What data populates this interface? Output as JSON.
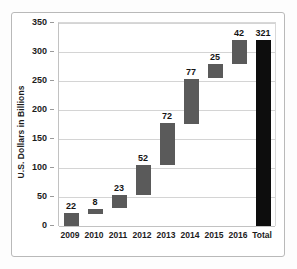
{
  "chart_data": {
    "type": "bar",
    "subtype": "waterfall",
    "title": "",
    "xlabel": "",
    "ylabel": "U.S. Dollars in Billions",
    "ylim": [
      0,
      350
    ],
    "ytick_values": [
      0,
      50,
      100,
      150,
      200,
      250,
      300,
      350
    ],
    "ytick_labels": [
      "0",
      "50",
      "100",
      "150",
      "200",
      "250",
      "300",
      "350"
    ],
    "grid": true,
    "legend": "none",
    "categories": [
      "2009",
      "2010",
      "2011",
      "2012",
      "2013",
      "2014",
      "2015",
      "2016",
      "Total"
    ],
    "values": [
      22,
      8,
      23,
      52,
      72,
      77,
      25,
      42,
      321
    ],
    "data_labels": [
      "22",
      "8",
      "23",
      "52",
      "72",
      "77",
      "25",
      "42",
      "321"
    ],
    "bars": [
      {
        "category": "2009",
        "label": "22",
        "value": 22,
        "base": 0,
        "top": 22,
        "kind": "increment",
        "color": "#5a5a5a"
      },
      {
        "category": "2010",
        "label": "8",
        "value": 8,
        "base": 22,
        "top": 30,
        "kind": "increment",
        "color": "#5a5a5a"
      },
      {
        "category": "2011",
        "label": "23",
        "value": 23,
        "base": 30,
        "top": 53,
        "kind": "increment",
        "color": "#5a5a5a"
      },
      {
        "category": "2012",
        "label": "52",
        "value": 52,
        "base": 53,
        "top": 105,
        "kind": "increment",
        "color": "#5a5a5a"
      },
      {
        "category": "2013",
        "label": "72",
        "value": 72,
        "base": 105,
        "top": 177,
        "kind": "increment",
        "color": "#5a5a5a"
      },
      {
        "category": "2014",
        "label": "77",
        "value": 77,
        "base": 177,
        "top": 254,
        "kind": "increment",
        "color": "#5a5a5a"
      },
      {
        "category": "2015",
        "label": "25",
        "value": 25,
        "base": 254,
        "top": 279,
        "kind": "increment",
        "color": "#5a5a5a"
      },
      {
        "category": "2016",
        "label": "42",
        "value": 42,
        "base": 279,
        "top": 321,
        "kind": "increment",
        "color": "#5a5a5a"
      },
      {
        "category": "Total",
        "label": "321",
        "value": 321,
        "base": 0,
        "top": 321,
        "kind": "total",
        "color": "#0d0d0d"
      }
    ]
  },
  "colors": {
    "increment_bar": "#5a5a5a",
    "total_bar": "#0d0d0d",
    "gridline": "#d4d4d4",
    "axis": "#c2c2c2",
    "frame": "#b9b9b9",
    "text": "#1c1c1c",
    "background": "#ffffff"
  }
}
